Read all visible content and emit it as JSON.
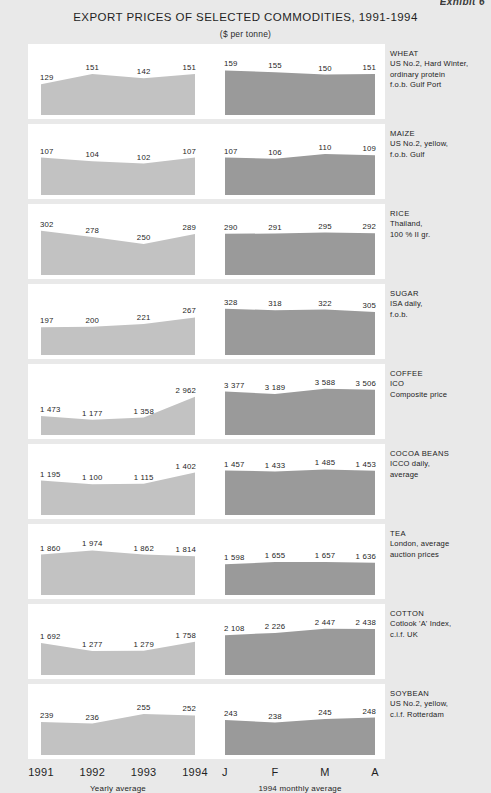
{
  "exhibit": {
    "label": "Exhibit 6"
  },
  "header": {
    "title": "EXPORT PRICES OF SELECTED COMMODITIES, 1991-1994",
    "subtitle": "($ per tonne)"
  },
  "axis": {
    "yearly": {
      "ticks": [
        "1991",
        "1992",
        "1993",
        "1994"
      ],
      "caption": "Yearly average"
    },
    "monthly": {
      "ticks": [
        "J",
        "F",
        "M",
        "A"
      ],
      "caption": "1994 monthly average"
    }
  },
  "colors": {
    "page_background": "#e9e9e9",
    "panel_background": "#ffffff",
    "yearly_area": "#c2c2c2",
    "monthly_area": "#9a9a9a",
    "text": "#1f1f1f"
  },
  "chart_data": {
    "type": "area",
    "title": "EXPORT PRICES OF SELECTED COMMODITIES, 1991-1994",
    "subtitle": "($ per tonne)",
    "ylabel": "$ per tonne",
    "xlabel": "",
    "grid": false,
    "legend": "none",
    "panels": [
      {
        "name": "WHEAT",
        "description": [
          "US No.2, Hard Winter,",
          "ordinary protein",
          "f.o.b. Gulf Port"
        ],
        "yearly": {
          "categories": [
            "1991",
            "1992",
            "1993",
            "1994"
          ],
          "values": [
            129,
            151,
            142,
            151
          ],
          "labels": [
            "129",
            "151",
            "142",
            "151"
          ]
        },
        "monthly": {
          "categories": [
            "J",
            "F",
            "M",
            "A"
          ],
          "values": [
            159,
            155,
            150,
            151
          ],
          "labels": [
            "159",
            "155",
            "150",
            "151"
          ]
        }
      },
      {
        "name": "MAIZE",
        "description": [
          "US No.2, yellow,",
          "f.o.b. Gulf"
        ],
        "yearly": {
          "categories": [
            "1991",
            "1992",
            "1993",
            "1994"
          ],
          "values": [
            107,
            104,
            102,
            107
          ],
          "labels": [
            "107",
            "104",
            "102",
            "107"
          ]
        },
        "monthly": {
          "categories": [
            "J",
            "F",
            "M",
            "A"
          ],
          "values": [
            107,
            106,
            110,
            109
          ],
          "labels": [
            "107",
            "106",
            "110",
            "109"
          ]
        }
      },
      {
        "name": "RICE",
        "description": [
          "Thailand,",
          "100 % II gr."
        ],
        "yearly": {
          "categories": [
            "1991",
            "1992",
            "1993",
            "1994"
          ],
          "values": [
            302,
            278,
            250,
            289
          ],
          "labels": [
            "302",
            "278",
            "250",
            "289"
          ]
        },
        "monthly": {
          "categories": [
            "J",
            "F",
            "M",
            "A"
          ],
          "values": [
            290,
            291,
            295,
            292
          ],
          "labels": [
            "290",
            "291",
            "295",
            "292"
          ]
        }
      },
      {
        "name": "SUGAR",
        "description": [
          "ISA daily,",
          "f.o.b."
        ],
        "yearly": {
          "categories": [
            "1991",
            "1992",
            "1993",
            "1994"
          ],
          "values": [
            197,
            200,
            221,
            267
          ],
          "labels": [
            "197",
            "200",
            "221",
            "267"
          ]
        },
        "monthly": {
          "categories": [
            "J",
            "F",
            "M",
            "A"
          ],
          "values": [
            328,
            318,
            322,
            305
          ],
          "labels": [
            "328",
            "318",
            "322",
            "305"
          ]
        }
      },
      {
        "name": "COFFEE",
        "description": [
          "ICO",
          "Composite price"
        ],
        "yearly": {
          "categories": [
            "1991",
            "1992",
            "1993",
            "1994"
          ],
          "values": [
            1473,
            1177,
            1358,
            2962
          ],
          "labels": [
            "1 473",
            "1 177",
            "1 358",
            "2 962"
          ]
        },
        "monthly": {
          "categories": [
            "J",
            "F",
            "M",
            "A"
          ],
          "values": [
            3377,
            3189,
            3588,
            3506
          ],
          "labels": [
            "3 377",
            "3 189",
            "3 588",
            "3 506"
          ]
        }
      },
      {
        "name": "COCOA BEANS",
        "description": [
          "ICCO daily,",
          "average"
        ],
        "yearly": {
          "categories": [
            "1991",
            "1992",
            "1993",
            "1994"
          ],
          "values": [
            1195,
            1100,
            1115,
            1402
          ],
          "labels": [
            "1 195",
            "1 100",
            "1 115",
            "1 402"
          ]
        },
        "monthly": {
          "categories": [
            "J",
            "F",
            "M",
            "A"
          ],
          "values": [
            1457,
            1433,
            1485,
            1453
          ],
          "labels": [
            "1 457",
            "1 433",
            "1 485",
            "1 453"
          ]
        }
      },
      {
        "name": "TEA",
        "description": [
          "London, average",
          "auction prices"
        ],
        "yearly": {
          "categories": [
            "1991",
            "1992",
            "1993",
            "1994"
          ],
          "values": [
            1860,
            1974,
            1862,
            1814
          ],
          "labels": [
            "1 860",
            "1 974",
            "1 862",
            "1 814"
          ]
        },
        "monthly": {
          "categories": [
            "J",
            "F",
            "M",
            "A"
          ],
          "values": [
            1598,
            1655,
            1657,
            1636
          ],
          "labels": [
            "1 598",
            "1 655",
            "1 657",
            "1 636"
          ]
        }
      },
      {
        "name": "COTTON",
        "description": [
          "Cotlook 'A' Index,",
          "c.i.f. UK"
        ],
        "yearly": {
          "categories": [
            "1991",
            "1992",
            "1993",
            "1994"
          ],
          "values": [
            1692,
            1277,
            1279,
            1758
          ],
          "labels": [
            "1 692",
            "1 277",
            "1 279",
            "1 758"
          ]
        },
        "monthly": {
          "categories": [
            "J",
            "F",
            "M",
            "A"
          ],
          "values": [
            2108,
            2226,
            2447,
            2438
          ],
          "labels": [
            "2 108",
            "2 226",
            "2 447",
            "2 438"
          ]
        }
      },
      {
        "name": "SOYBEAN",
        "description": [
          "US No.2, yellow,",
          "c.i.f. Rotterdam"
        ],
        "yearly": {
          "categories": [
            "1991",
            "1992",
            "1993",
            "1994"
          ],
          "values": [
            239,
            236,
            255,
            252
          ],
          "labels": [
            "239",
            "236",
            "255",
            "252"
          ]
        },
        "monthly": {
          "categories": [
            "J",
            "F",
            "M",
            "A"
          ],
          "values": [
            243,
            238,
            245,
            248
          ],
          "labels": [
            "243",
            "238",
            "245",
            "248"
          ]
        }
      }
    ]
  }
}
